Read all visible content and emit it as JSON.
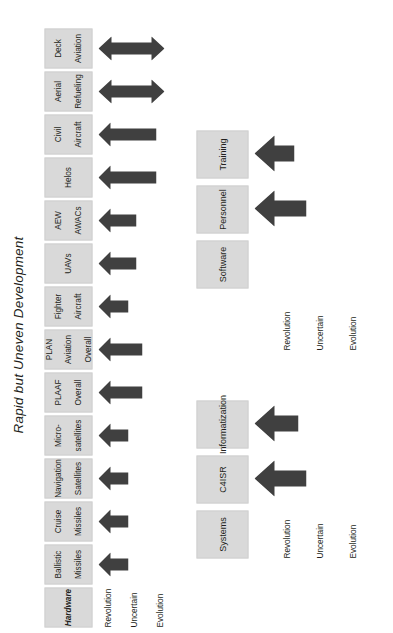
{
  "figure": {
    "title": "Rapid but Uneven Development",
    "accent_color": "#404040",
    "box_fill": "#d9d9d9",
    "text_color": "#231f20"
  },
  "scale_labels": [
    "Revolution",
    "Uncertain",
    "Evolution"
  ],
  "group_hardware": {
    "header": "Hardware",
    "categories": [
      {
        "label_lines": [
          "Ballistic",
          "Missiles"
        ],
        "level": "Revolution",
        "arrow": "single-left"
      },
      {
        "label_lines": [
          "Cruise",
          "Missiles"
        ],
        "level": "Revolution",
        "arrow": "single-left"
      },
      {
        "label_lines": [
          "Navigation",
          "Satellites"
        ],
        "level": "Revolution",
        "arrow": "single-left"
      },
      {
        "label_lines": [
          "Micro-",
          "satellites"
        ],
        "level": "Revolution",
        "arrow": "single-left"
      },
      {
        "label_lines": [
          "PLAAF",
          "Overall"
        ],
        "level": "Uncertain",
        "arrow": "single-left"
      },
      {
        "label_lines": [
          "PLAN",
          "Aviation",
          "Overall"
        ],
        "level": "Uncertain",
        "arrow": "single-left"
      },
      {
        "label_lines": [
          "Fighter",
          "Aircraft"
        ],
        "level": "Revolution",
        "arrow": "single-left"
      },
      {
        "label_lines": [
          "UAVs"
        ],
        "level": "Uncertain-High",
        "arrow": "single-left"
      },
      {
        "label_lines": [
          "AEW",
          "AWACs"
        ],
        "level": "Uncertain-High",
        "arrow": "single-left"
      },
      {
        "label_lines": [
          "Helos"
        ],
        "level": "Evolution",
        "arrow": "single-left"
      },
      {
        "label_lines": [
          "Civil",
          "Aircraft"
        ],
        "level": "Evolution",
        "arrow": "single-left"
      },
      {
        "label_lines": [
          "Aerial",
          "Refueling"
        ],
        "level": "Revolution-to-Evolution",
        "arrow": "double"
      },
      {
        "label_lines": [
          "Deck",
          "Aviation"
        ],
        "level": "Revolution-to-Evolution",
        "arrow": "double"
      }
    ]
  },
  "group_systems": {
    "header": "Systems",
    "categories": [
      {
        "label_lines": [
          "C4ISR"
        ],
        "level": "Revolution",
        "arrow": "single-left-large"
      },
      {
        "label_lines": [
          "Informatization"
        ],
        "level": "Revolution",
        "arrow": "single-left-large"
      },
      {
        "label_lines": [
          "Software"
        ],
        "level": "",
        "arrow": "none"
      },
      {
        "label_lines": [
          "Personnel"
        ],
        "level": "Revolution",
        "arrow": "single-left-large"
      },
      {
        "label_lines": [
          "Training"
        ],
        "level": "Uncertain",
        "arrow": "single-left-large"
      }
    ]
  }
}
